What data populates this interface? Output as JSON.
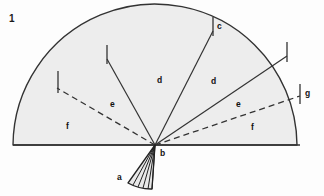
{
  "figure": {
    "number": "1",
    "caption_labels": {
      "a": "a",
      "b": "b",
      "c": "c",
      "d_left": "d",
      "d_right": "d",
      "e_left": "e",
      "e_right": "e",
      "f_left": "f",
      "f_right": "f",
      "g": "g"
    },
    "colors": {
      "background": "#fdfdfd",
      "sector_fill": "#ededed",
      "small_fan_fill": "#e8e8e8",
      "stroke": "#333333",
      "label_text": "#111111"
    },
    "geometry": {
      "vertex_b": [
        155,
        145
      ],
      "baseline_left": [
        13,
        145
      ],
      "baseline_right": [
        300,
        145
      ],
      "arc_radius": 142,
      "tick_marks": 4,
      "small_fan_rays": 6
    },
    "labels": [
      {
        "key": "a",
        "text": "a",
        "x": 117,
        "y": 173
      },
      {
        "key": "b",
        "text": "b",
        "x": 160,
        "y": 149
      },
      {
        "key": "c",
        "text": "c",
        "x": 217,
        "y": 22
      },
      {
        "key": "d_left",
        "text": "d",
        "x": 157,
        "y": 76
      },
      {
        "key": "d_right",
        "text": "d",
        "x": 211,
        "y": 77
      },
      {
        "key": "e_left",
        "text": "e",
        "x": 110,
        "y": 100
      },
      {
        "key": "e_right",
        "text": "e",
        "x": 236,
        "y": 100
      },
      {
        "key": "f_left",
        "text": "f",
        "x": 66,
        "y": 122
      },
      {
        "key": "f_right",
        "text": "f",
        "x": 251,
        "y": 123
      },
      {
        "key": "g",
        "text": "g",
        "x": 305,
        "y": 89
      }
    ]
  }
}
